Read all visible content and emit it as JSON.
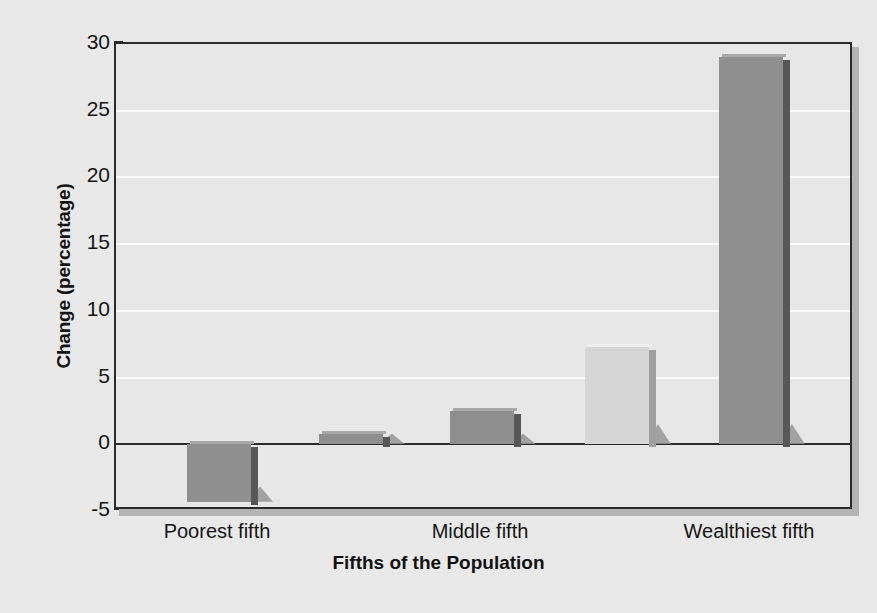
{
  "chart_data": {
    "type": "bar",
    "title": "",
    "xlabel": "Fifths of the Population",
    "ylabel": "Change (percentage)",
    "categories": [
      "Poorest fifth",
      "",
      "Middle fifth",
      "",
      "Wealthiest fifth"
    ],
    "tick_labels": [
      "Poorest fifth",
      "Middle fifth",
      "Wealthiest fifth"
    ],
    "values": [
      -4.3,
      0.8,
      2.5,
      7.3,
      29.0
    ],
    "bar_colors": [
      "#8f8f8f",
      "#8f8f8f",
      "#8f8f8f",
      "#d6d6d6",
      "#8f8f8f"
    ],
    "ylim": [
      -5,
      30
    ],
    "yticks": [
      30,
      25,
      20,
      15,
      10,
      5,
      0,
      -5
    ],
    "ytick_labels": [
      "30",
      "25",
      "20",
      "15",
      "10",
      "5",
      "0",
      "-5"
    ],
    "grid": true,
    "gridlines_at": [
      25,
      20,
      15,
      10,
      5
    ],
    "zero_line": 0,
    "legend": "none",
    "style": "3d-shadowed-bars"
  },
  "axis": {
    "y_title": "Change (percentage)",
    "x_title": "Fifths of the Population"
  },
  "colors": {
    "background": "#e9e9e9",
    "plot_background": "#e7e7e7",
    "frame": "#2b2b2b",
    "gridline": "#fbfbfb",
    "bar_default": "#8f8f8f",
    "bar_highlight": "#d6d6d6",
    "bar_side": "#6f6f6f",
    "text": "#141414"
  }
}
